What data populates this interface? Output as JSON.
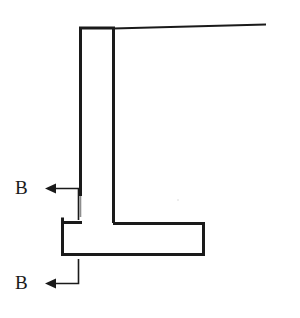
{
  "figure": {
    "type": "engineering-drawing",
    "background_color": "#ffffff",
    "line_color": "#1a1a1a",
    "stroke_width_px": 3
  },
  "labels": {
    "section_upper": "B",
    "section_lower": "B"
  },
  "caption": {
    "text": "",
    "visible": false
  },
  "geometry": {
    "backfill_line": {
      "name": "top-backfill-surface-line",
      "x1": 114,
      "y1": 28,
      "x2": 266,
      "y2": 24
    },
    "stem": {
      "name": "wall-stem",
      "top_y": 28,
      "left_x": 80,
      "right_x": 114,
      "base_y": 222,
      "left_line_fade_y": 216
    },
    "footing": {
      "name": "wall-footing-slab",
      "left_x": 61,
      "right_x": 205,
      "top_y": 222,
      "bottom_y": 256
    },
    "section_arrow_upper": {
      "name": "section-arrow-b-upper",
      "vertical_x": 78,
      "vertical_top_y": 188,
      "vertical_bottom_y": 222,
      "horizontal_y": 188,
      "tip_x": 45
    },
    "section_arrow_lower": {
      "name": "section-arrow-b-lower",
      "vertical_x": 78,
      "vertical_top_y": 259,
      "vertical_bottom_y": 283,
      "horizontal_y": 283,
      "tip_x": 45
    }
  }
}
